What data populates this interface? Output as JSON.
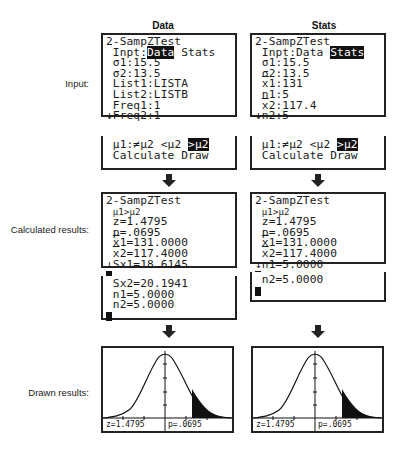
{
  "columns": {
    "data": {
      "header": "Data"
    },
    "stats": {
      "header": "Stats"
    }
  },
  "row_labels": {
    "input": "Input:",
    "calculated": "Calculated results:",
    "drawn": "Drawn results:"
  },
  "data_input": {
    "title": "2-SampZTest",
    "inpt_label": "Inpt:",
    "inpt_selected": "Data",
    "inpt_other": "Stats",
    "sigma1": "σ1:15.5",
    "sigma2": "σ2:13.5",
    "list1": "List1:LISTA",
    "list2": "List2:LISTB",
    "freq1": "Freq1:1",
    "freq2": "↓Freq2:1"
  },
  "stats_input": {
    "title": "2-SampZTest",
    "inpt_label": "Inpt:",
    "inpt_other": "Data",
    "inpt_selected": "Stats",
    "sigma1": "σ1:15.5",
    "sigma2": "σ2:13.5",
    "xbar1_val": "1:131",
    "n1": "n1:5",
    "xbar2_val": "2:117.4",
    "n2": "↓n2:5"
  },
  "alt_hyp": {
    "label": "μ1:",
    "opt1": "≠μ2",
    "opt2": "<μ2",
    "opt3_selected": ">μ2",
    "calculate": "Calculate",
    "draw": "Draw"
  },
  "data_results": {
    "title": "2-SampZTest",
    "hyp": "μ1>μ2",
    "z": "z=1.4795",
    "p": "p=.0695",
    "xbar1": "1=131.0000",
    "xbar2": "2=117.4000",
    "sx1": "↓Sx1=18.6145",
    "sx2": "Sx2=20.1941",
    "n1": "n1=5.0000",
    "n2": "n2=5.0000"
  },
  "stats_results": {
    "title": "2-SampZTest",
    "hyp": "μ1>μ2",
    "z": "z=1.4795",
    "p": "p=.0695",
    "xbar1": "1=131.0000",
    "xbar2": "2=117.4000",
    "n1": "↓n1=5.0000",
    "n2": "n2=5.0000"
  },
  "graph": {
    "z_label": "z=1.4795",
    "p_label": "p=.0695"
  }
}
